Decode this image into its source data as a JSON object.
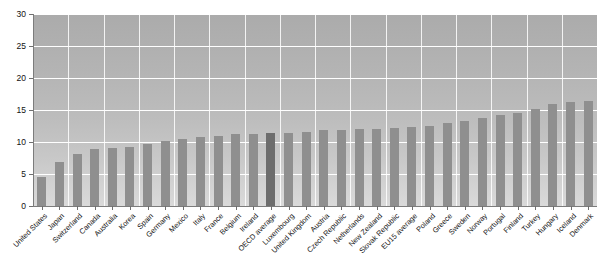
{
  "chart_data": {
    "type": "bar",
    "title": "",
    "xlabel": "",
    "ylabel": "",
    "ylim": [
      0,
      30
    ],
    "yticks": [
      0,
      5,
      10,
      15,
      20,
      25,
      30
    ],
    "grid": true,
    "legend": false,
    "highlight_category": "OECD average",
    "colors": {
      "bar": "#8f8f8f",
      "bar_highlight": "#6d6d6d",
      "plot_background": "#b4b4b4",
      "gridline": "#ffffff",
      "axis": "#7c7c7c",
      "text": "#141414"
    },
    "categories": [
      "United States",
      "Japan",
      "Switzerland",
      "Canada",
      "Australia",
      "Korea",
      "Spain",
      "Germany",
      "Mexico",
      "Italy",
      "France",
      "Belgium",
      "Ireland",
      "OECD average",
      "Luxembourg",
      "United Kingdom",
      "Austria",
      "Czech Republic",
      "Netherlands",
      "New Zealand",
      "Slovak Republic",
      "EU15 average",
      "Poland",
      "Greece",
      "Sweden",
      "Norway",
      "Portugal",
      "Finland",
      "Turkey",
      "Hungary",
      "Iceland",
      "Denmark"
    ],
    "values": [
      4.5,
      6.9,
      8.2,
      8.9,
      9.0,
      9.2,
      9.7,
      10.2,
      10.5,
      10.8,
      10.9,
      11.2,
      11.3,
      11.4,
      11.4,
      11.5,
      11.8,
      11.9,
      12.0,
      12.1,
      12.2,
      12.3,
      12.5,
      13.0,
      13.3,
      13.8,
      14.2,
      14.6,
      15.1,
      16.0,
      16.2,
      16.4
    ]
  },
  "axis": {
    "y_tick_labels": [
      "0",
      "5",
      "10",
      "15",
      "20",
      "25",
      "30"
    ]
  },
  "header": {
    "title_sliver": ""
  }
}
